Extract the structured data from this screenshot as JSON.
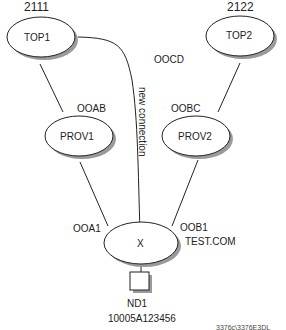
{
  "nodes": {
    "top1": {
      "label": "TOP1",
      "number": "2111"
    },
    "top2": {
      "label": "TOP2",
      "number": "2122"
    },
    "prov1": {
      "label": "PROV1"
    },
    "prov2": {
      "label": "PROV2"
    },
    "x": {
      "label": "X",
      "domain": "TEST.COM"
    },
    "nd1": {
      "label": "ND1",
      "address": "10005A123456"
    }
  },
  "links": {
    "ooab": "OOAB",
    "oobc": "OOBC",
    "oocd": "OOCD",
    "ooa1": "OOA1",
    "oob1": "OOB1",
    "new_connection": "new connection"
  },
  "figure_id": "3376c\\3376E3DL",
  "colors": {
    "stroke": "#222222",
    "shadow": "#9a9a9a",
    "fill": "#ffffff"
  }
}
